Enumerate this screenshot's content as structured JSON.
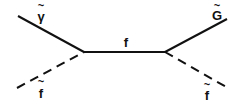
{
  "diagram": {
    "type": "feynman-diagram",
    "propagator": {
      "label": "f",
      "style": "solid"
    },
    "external_lines": [
      {
        "id": "in-photino",
        "label": "γ",
        "tilde": "~",
        "style": "solid",
        "side": "left-top"
      },
      {
        "id": "in-sfermion",
        "label": "f",
        "tilde": "~",
        "style": "dashed",
        "side": "left-bottom"
      },
      {
        "id": "out-gravitino",
        "label": "G",
        "tilde": "~",
        "style": "solid",
        "side": "right-top"
      },
      {
        "id": "out-sfermion",
        "label": "f",
        "tilde": "~",
        "style": "dashed",
        "side": "right-bottom"
      }
    ]
  }
}
